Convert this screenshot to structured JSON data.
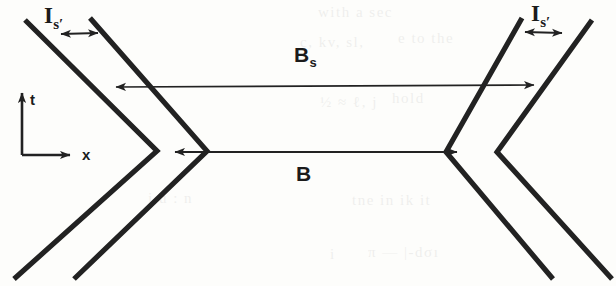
{
  "figure": {
    "background_color": "#fdfdfb",
    "stroke_color": "#222222",
    "thick_stroke_width": 5,
    "thin_stroke_width": 1.6
  },
  "labels": {
    "top_left_interval": {
      "base": "I",
      "sub": "s′"
    },
    "top_right_interval": {
      "base": "I",
      "sub": "s′"
    },
    "upper_span": {
      "base": "B",
      "sub": "s"
    },
    "lower_span": {
      "base": "B",
      "sub": ""
    },
    "axis_time": "t",
    "axis_space": "x"
  },
  "axes": {
    "origin": {
      "x": 22,
      "y": 155
    },
    "time_arrow_label": "t",
    "space_arrow_label": "x"
  },
  "arrows": {
    "upper_span": {
      "label": "B_s",
      "y": 86,
      "x_start": 113,
      "x_end": 537,
      "heads": "both"
    },
    "lower_span": {
      "label": "B",
      "y": 152,
      "x_start": 172,
      "x_end": 460,
      "heads": "both"
    },
    "left_interval": {
      "label": "I_s'",
      "x_start": 57,
      "x_end": 101,
      "y": 34,
      "heads": "both"
    },
    "right_interval": {
      "label": "I_s'",
      "x_start": 521,
      "x_end": 565,
      "y": 32,
      "heads": "both"
    }
  },
  "ghost_text": [
    {
      "text": "with  a  sec",
      "x": 318,
      "y": 10
    },
    {
      "text": "e  to  the",
      "x": 398,
      "y": 36
    },
    {
      "text": "c, kv, sl,",
      "x": 300,
      "y": 40
    },
    {
      "text": "hold",
      "x": 392,
      "y": 96
    },
    {
      "text": "½   ≈   ℓ, j",
      "x": 320,
      "y": 100
    },
    {
      "text": "j  u  :  n",
      "x": 148,
      "y": 196
    },
    {
      "text": "tne   in   ik  it",
      "x": 352,
      "y": 198
    },
    {
      "text": "π — |-dσı",
      "x": 368,
      "y": 250
    },
    {
      "text": "i",
      "x": 330,
      "y": 252
    }
  ]
}
